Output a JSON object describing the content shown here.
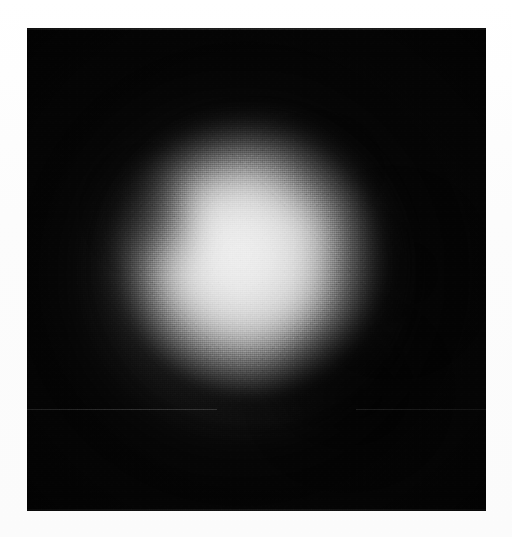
{
  "page": {
    "width": 512,
    "height": 537,
    "background_color": "#fdfdfd",
    "margin_color": "#ffffff",
    "caption": ""
  },
  "image_panel": {
    "label": "grayscale-intensity-image",
    "x": 27,
    "y": 28,
    "width": 459,
    "height": 483,
    "background_color": "#050505",
    "border_color": "#050505",
    "texture": "halftone-dither",
    "grain": "film-grain"
  },
  "chart_data": {
    "type": "heatmap",
    "title": "",
    "subtitle": "",
    "xlabel": "",
    "ylabel": "",
    "colormap": "grayscale",
    "grid": false,
    "legend": "none",
    "axis_visible": false,
    "tick_labels": [],
    "annotations": [],
    "value_range": [
      0,
      255
    ],
    "display_range_hex": [
      "#050505",
      "#e6e6e6"
    ],
    "field_description": "Smooth radially-symmetric bright blob (beam / intensity profile) centered slightly left-of-center on a near-black field, with two darker lobes intruding from the upper-left edge and the lower-right.",
    "features": [
      {
        "name": "primary-blob",
        "shape": "disc",
        "center_x": 255,
        "center_y": 265,
        "radius": 148,
        "peak_value": 230,
        "peak_hex": "#e6e6e6",
        "falloff": "gaussian"
      },
      {
        "name": "bright-plateau",
        "shape": "ellipse",
        "center_x": 248,
        "center_y": 263,
        "radius_x": 95,
        "radius_y": 102,
        "peak_value": 240,
        "peak_hex": "#f0f0f0"
      },
      {
        "name": "upper-left-notch",
        "shape": "dark-lobe",
        "center_x": 148,
        "center_y": 211,
        "radius": 43,
        "depth": 0.38
      },
      {
        "name": "lower-right-intrusion",
        "shape": "dark-lobe",
        "center_x": 347,
        "center_y": 390,
        "radius_x": 75,
        "radius_y": 70,
        "depth": 0.5
      },
      {
        "name": "right-edge-flattening",
        "shape": "dark-lobe",
        "center_x": 392,
        "center_y": 273,
        "radius_x": 65,
        "radius_y": 75,
        "depth": 0.3
      }
    ],
    "corner_values": {
      "top_left": 5,
      "top_right": 5,
      "bottom_left": 8,
      "bottom_right": 6
    },
    "profile_horizontal": {
      "description": "Intensity across the panel at y = 265 (blob mid-height)",
      "x": [
        27,
        60,
        90,
        115,
        140,
        165,
        195,
        225,
        255,
        285,
        315,
        345,
        375,
        405,
        435,
        465,
        486
      ],
      "values": [
        6,
        10,
        22,
        55,
        118,
        176,
        214,
        228,
        232,
        228,
        218,
        196,
        152,
        92,
        38,
        12,
        6
      ]
    },
    "profile_vertical": {
      "description": "Intensity down the panel at x = 255 (blob mid-width)",
      "y": [
        28,
        60,
        90,
        120,
        150,
        180,
        215,
        250,
        285,
        320,
        355,
        390,
        420,
        450,
        480,
        511
      ],
      "values": [
        5,
        9,
        26,
        72,
        140,
        190,
        220,
        232,
        230,
        222,
        205,
        168,
        110,
        48,
        14,
        7
      ]
    },
    "scan_artifacts": [
      {
        "name": "top-seam",
        "orientation": "horizontal",
        "y": 29,
        "value": 120
      },
      {
        "name": "lower-left-scan-line",
        "orientation": "horizontal",
        "y": 409,
        "value": 110
      }
    ]
  }
}
